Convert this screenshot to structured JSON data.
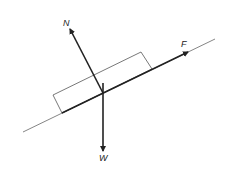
{
  "diagram": {
    "forces": [
      {
        "id": "N",
        "label": "N",
        "direction": "perpendicular to incline, upward-left"
      },
      {
        "id": "F",
        "label": "F",
        "direction": "along incline, up-slope"
      },
      {
        "id": "W",
        "label": "W",
        "direction": "vertically downward"
      }
    ],
    "colors": {
      "line": "#222222",
      "incline": "#555555",
      "block": "#555555",
      "background": "#ffffff"
    }
  }
}
